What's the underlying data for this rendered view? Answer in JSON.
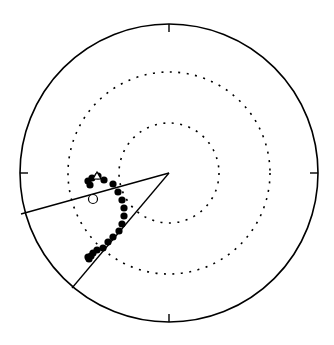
{
  "chart_data": {
    "type": "scatter",
    "subtype": "equal-area stereonet (polar projection)",
    "title": "",
    "xlabel": "",
    "ylabel": "",
    "grid": "dotted concentric circles",
    "legend": null,
    "frame": {
      "center": [
        169,
        173
      ],
      "radius": 149,
      "stroke": "#000000",
      "ticks": [
        "N",
        "E",
        "S",
        "W"
      ]
    },
    "grid_circles": [
      {
        "radius": 50,
        "style": "dotted"
      },
      {
        "radius": 101,
        "style": "dotted"
      }
    ],
    "great_circle_lines": [
      {
        "name": "line-upper",
        "from": [
          169,
          173
        ],
        "to": [
          21,
          214
        ]
      },
      {
        "name": "line-lower",
        "from": [
          169,
          173
        ],
        "to": [
          72,
          288
        ]
      }
    ],
    "series": [
      {
        "name": "filled-points",
        "marker": "filled-circle",
        "color": "#000000",
        "points": [
          [
            88,
            181
          ],
          [
            90,
            185
          ],
          [
            92,
            178
          ],
          [
            98,
            176
          ],
          [
            104,
            180
          ],
          [
            113,
            184
          ],
          [
            118,
            192
          ],
          [
            122,
            200
          ],
          [
            124,
            208
          ],
          [
            124,
            216
          ],
          [
            122,
            224
          ],
          [
            119,
            231
          ],
          [
            113,
            237
          ],
          [
            108,
            242
          ],
          [
            103,
            248
          ],
          [
            97,
            250
          ],
          [
            93,
            253
          ],
          [
            91,
            256
          ],
          [
            89,
            259
          ],
          [
            88,
            257
          ]
        ]
      },
      {
        "name": "open-points",
        "marker": "open-circle",
        "color": "#000000",
        "points": [
          [
            93,
            199
          ]
        ]
      },
      {
        "name": "start-marker",
        "marker": "triangle",
        "color": "#000000",
        "points": [
          [
            97,
            177
          ]
        ]
      }
    ]
  }
}
